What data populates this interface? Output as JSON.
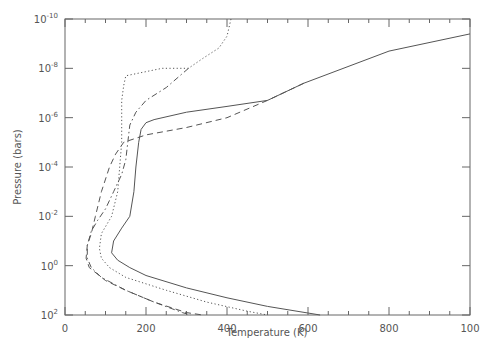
{
  "chart_data": {
    "type": "line",
    "title": "",
    "xlabel": "Temperature (K)",
    "ylabel": "Pressure (bars)",
    "xlim": [
      0,
      1000
    ],
    "ylim": [
      100,
      1e-10
    ],
    "yscale": "log",
    "y_inverted": true,
    "grid": false,
    "legend": "none",
    "x_ticks": [
      "0",
      "200",
      "400",
      "600",
      "800",
      "100"
    ],
    "y_ticks": [
      {
        "base": "10",
        "exp": "-10"
      },
      {
        "base": "10",
        "exp": "-8"
      },
      {
        "base": "10",
        "exp": "-6"
      },
      {
        "base": "10",
        "exp": "-4"
      },
      {
        "base": "10",
        "exp": "-2"
      },
      {
        "base": "10",
        "exp": "0"
      },
      {
        "base": "10",
        "exp": "2"
      }
    ],
    "series": [
      {
        "name": "solid",
        "style": "solid",
        "points": [
          [
            1000,
            4e-10
          ],
          [
            800,
            2e-09
          ],
          [
            590,
            4e-08
          ],
          [
            500,
            2e-07
          ],
          [
            400,
            3.5e-07
          ],
          [
            300,
            6e-07
          ],
          [
            220,
            1.2e-06
          ],
          [
            200,
            1.6e-06
          ],
          [
            188,
            3e-06
          ],
          [
            182,
            1e-05
          ],
          [
            175,
            0.0001
          ],
          [
            170,
            0.001
          ],
          [
            160,
            0.01
          ],
          [
            140,
            0.03
          ],
          [
            120,
            0.1
          ],
          [
            115,
            0.3
          ],
          [
            130,
            0.6
          ],
          [
            160,
            1.2
          ],
          [
            200,
            2.5
          ],
          [
            300,
            8
          ],
          [
            400,
            20
          ],
          [
            500,
            45
          ],
          [
            630,
            100
          ]
        ]
      },
      {
        "name": "dashed",
        "style": "dashed",
        "points": [
          [
            590,
            4e-08
          ],
          [
            500,
            2e-07
          ],
          [
            400,
            1e-06
          ],
          [
            300,
            2.5e-06
          ],
          [
            200,
            5e-06
          ],
          [
            145,
            1e-05
          ],
          [
            125,
            3e-05
          ],
          [
            110,
            0.0001
          ],
          [
            90,
            0.001
          ],
          [
            75,
            0.01
          ],
          [
            65,
            0.05
          ],
          [
            55,
            0.15
          ],
          [
            52,
            0.5
          ],
          [
            60,
            1.2
          ],
          [
            100,
            4
          ],
          [
            150,
            10
          ],
          [
            220,
            30
          ],
          [
            300,
            80
          ],
          [
            340,
            100
          ]
        ]
      },
      {
        "name": "dotted",
        "style": "dotted",
        "points": [
          [
            410,
            1e-10
          ],
          [
            400,
            5e-10
          ],
          [
            380,
            1.5e-09
          ],
          [
            340,
            4e-09
          ],
          [
            305,
            1e-08
          ],
          [
            240,
            1e-08
          ],
          [
            150,
            2e-08
          ],
          [
            145,
            5e-08
          ],
          [
            140,
            2e-07
          ],
          [
            140,
            1e-06
          ],
          [
            140,
            1e-05
          ],
          [
            135,
            0.0001
          ],
          [
            130,
            0.001
          ],
          [
            115,
            0.01
          ],
          [
            90,
            0.05
          ],
          [
            85,
            0.2
          ],
          [
            90,
            0.5
          ],
          [
            110,
            1.2
          ],
          [
            150,
            3
          ],
          [
            250,
            10
          ],
          [
            350,
            30
          ],
          [
            450,
            70
          ],
          [
            500,
            100
          ]
        ]
      },
      {
        "name": "dash-dot",
        "style": "dashdot",
        "points": [
          [
            305,
            1e-08
          ],
          [
            250,
            6e-08
          ],
          [
            200,
            2e-07
          ],
          [
            175,
            6e-07
          ],
          [
            160,
            2e-06
          ],
          [
            155,
            1e-05
          ],
          [
            150,
            5e-05
          ],
          [
            140,
            0.0002
          ],
          [
            120,
            0.001
          ],
          [
            100,
            0.005
          ],
          [
            80,
            0.015
          ],
          [
            65,
            0.04
          ],
          [
            55,
            0.15
          ],
          [
            55,
            0.5
          ],
          [
            65,
            1.2
          ],
          [
            90,
            3
          ],
          [
            150,
            10
          ],
          [
            220,
            30
          ],
          [
            290,
            80
          ],
          [
            310,
            100
          ]
        ]
      }
    ]
  }
}
